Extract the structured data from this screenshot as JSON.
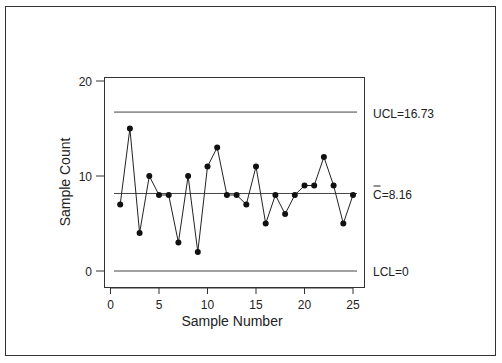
{
  "chart_data": {
    "type": "line",
    "title": "",
    "xlabel": "Sample Number",
    "ylabel": "Sample Count",
    "x": [
      1,
      2,
      3,
      4,
      5,
      6,
      7,
      8,
      9,
      10,
      11,
      12,
      13,
      14,
      15,
      16,
      17,
      18,
      19,
      20,
      21,
      22,
      23,
      24,
      25
    ],
    "series": [
      {
        "name": "Sample Count",
        "values": [
          7,
          15,
          4,
          10,
          8,
          8,
          3,
          10,
          2,
          11,
          13,
          8,
          8,
          7,
          11,
          5,
          8,
          6,
          8,
          9,
          9,
          12,
          9,
          5,
          8
        ]
      }
    ],
    "xlim": [
      0,
      25
    ],
    "ylim": [
      0,
      20
    ],
    "xticks": [
      0,
      5,
      10,
      15,
      20,
      25
    ],
    "yticks": [
      0,
      10,
      20
    ],
    "grid": false,
    "control_limits": [
      {
        "name": "UCL",
        "value": 16.73,
        "label": "UCL=16.73"
      },
      {
        "name": "CL",
        "value": 8.16,
        "label": "C=8.16",
        "bar_over": "C"
      },
      {
        "name": "LCL",
        "value": 0,
        "label": "LCL=0"
      }
    ]
  },
  "labels": {
    "ucl": "UCL=16.73",
    "cl_symbol": "C",
    "cl_value": "=8.16",
    "lcl": "LCL=0"
  }
}
